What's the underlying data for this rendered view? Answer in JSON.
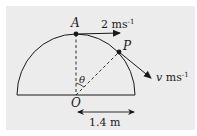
{
  "diagram": {
    "type": "mechanics-semicircle",
    "points": {
      "A": {
        "label": "A"
      },
      "P": {
        "label": "P"
      },
      "O": {
        "label": "O"
      }
    },
    "velocity_A": {
      "value": "2",
      "unit": "ms",
      "exponent": "-1"
    },
    "velocity_P": {
      "value": "v",
      "unit": "ms",
      "exponent": "-1"
    },
    "angle": {
      "label": "θ"
    },
    "radius": {
      "label": "1.4 m"
    }
  },
  "colors": {
    "background": "#ececec",
    "stroke": "#1a1a1a"
  }
}
